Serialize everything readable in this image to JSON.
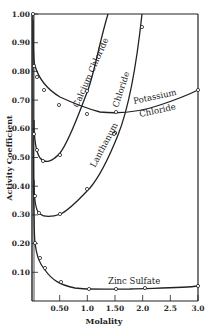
{
  "chart_data": {
    "type": "line",
    "title": "",
    "xlabel": "Molality",
    "ylabel": "Activity Coefficient",
    "xlim": [
      0,
      3.0
    ],
    "ylim": [
      0,
      1.0
    ],
    "grid": false,
    "legend": "inline labels on curves",
    "x_ticks": [
      "0.50",
      "1.0",
      "1.50",
      "2.0",
      "2.5",
      "3.0"
    ],
    "y_ticks": [
      "0.10",
      "0.20",
      "0.30",
      "0.40",
      "0.50",
      "0.60",
      "0.70",
      "0.80",
      "0.90",
      "1.00"
    ],
    "series": [
      {
        "name": "Potassium Chloride",
        "label_lines": [
          "Potassium",
          "Chloride"
        ],
        "x": [
          0.001,
          0.05,
          0.1,
          0.3,
          0.5,
          1.0,
          1.5,
          3.0
        ],
        "y": [
          1.0,
          0.82,
          0.78,
          0.73,
          0.68,
          0.63,
          0.61,
          0.73
        ],
        "points": [
          [
            0.01,
            0.82
          ],
          [
            0.05,
            0.78
          ],
          [
            0.2,
            0.73
          ],
          [
            0.5,
            0.68
          ],
          [
            1.0,
            0.65
          ],
          [
            2.0,
            0.64
          ],
          [
            3.0,
            0.73
          ]
        ]
      },
      {
        "name": "Calcium Chloride",
        "label_lines": [
          "Calcium Chloride"
        ],
        "points": [
          [
            0.01,
            0.58
          ],
          [
            0.05,
            0.52
          ],
          [
            0.2,
            0.48
          ],
          [
            0.5,
            0.51
          ],
          [
            1.0,
            0.73
          ],
          [
            1.8,
            1.0
          ]
        ]
      },
      {
        "name": "Lanthanum Chloride",
        "label_lines": [
          "Lanthanum",
          "Chloride"
        ],
        "points": [
          [
            0.005,
            0.36
          ],
          [
            0.05,
            0.31
          ],
          [
            0.5,
            0.3
          ],
          [
            1.0,
            0.39
          ],
          [
            1.5,
            0.54
          ],
          [
            2.0,
            0.88
          ],
          [
            2.1,
            1.0
          ]
        ]
      },
      {
        "name": "Zinc Sulfate",
        "label_lines": [
          "Zinc Sulfate"
        ],
        "points": [
          [
            0.005,
            0.2
          ],
          [
            0.05,
            0.15
          ],
          [
            0.2,
            0.11
          ],
          [
            0.5,
            0.06
          ],
          [
            1.0,
            0.04
          ],
          [
            1.5,
            0.04
          ],
          [
            2.0,
            0.04
          ],
          [
            3.0,
            0.05
          ]
        ]
      }
    ]
  },
  "axis": {
    "x_title": "Molality",
    "y_title": "Activity Coefficient"
  },
  "labels": {
    "calcium": "Calcium Chloride",
    "lanthanum": "Lanthanum",
    "lanthanum_chloride": "Chloride",
    "potassium": "Potassium",
    "potassium_chloride": "Chloride",
    "zinc": "Zinc Sulfate"
  }
}
